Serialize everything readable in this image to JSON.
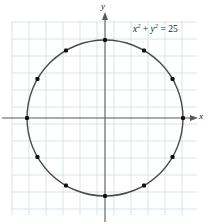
{
  "figure": {
    "background_color": "#ffffff",
    "grid": {
      "line_color": "#cfdce8",
      "spacing_px": 17,
      "left_px": 12,
      "top_px": 22,
      "right_px": 197,
      "bottom_px": 215,
      "visible": true
    },
    "axes": {
      "color": "#4d4d4d",
      "x_label": "x",
      "y_label": "y",
      "origin_px": [
        105,
        118
      ],
      "arrowheads": true
    },
    "curve": {
      "color": "#4a4a4a",
      "stroke_width": 1.4,
      "point_color": "#111111",
      "point_size_px": 4
    },
    "equation": {
      "lhs_x": "x",
      "lhs_x_exp": "2",
      "plus": " + ",
      "lhs_y": "y",
      "lhs_y_exp": "2",
      "equals": " = ",
      "rhs": "25",
      "full": "x² + y² = 25"
    }
  },
  "chart_data": {
    "type": "scatter",
    "xlabel": "x",
    "ylabel": "y",
    "xlim": [
      -5.5,
      5.4
    ],
    "ylim": [
      -5.5,
      5.6
    ],
    "grid": true,
    "legend": null,
    "curves": [
      {
        "name": "circle",
        "equation": "x^2 + y^2 = 25",
        "center": [
          0,
          0
        ],
        "radius": 5
      }
    ],
    "annotations": [
      {
        "text": "x² + y² = 25",
        "x": 2.4,
        "y": 5.0
      }
    ],
    "points": [
      {
        "label": "0 deg",
        "x": 5.0,
        "y": 0.0
      },
      {
        "label": "30 deg",
        "x": 4.33,
        "y": 2.5
      },
      {
        "label": "60 deg",
        "x": 2.5,
        "y": 4.33
      },
      {
        "label": "90 deg",
        "x": 0.0,
        "y": 5.0
      },
      {
        "label": "120 deg",
        "x": -2.5,
        "y": 4.33
      },
      {
        "label": "150 deg",
        "x": -4.33,
        "y": 2.5
      },
      {
        "label": "180 deg",
        "x": -5.0,
        "y": 0.0
      },
      {
        "label": "210 deg",
        "x": -4.33,
        "y": -2.5
      },
      {
        "label": "240 deg",
        "x": -2.5,
        "y": -4.33
      },
      {
        "label": "270 deg",
        "x": 0.0,
        "y": -5.0
      },
      {
        "label": "300 deg",
        "x": 2.5,
        "y": -4.33
      },
      {
        "label": "330 deg",
        "x": 4.33,
        "y": -2.5
      }
    ]
  }
}
